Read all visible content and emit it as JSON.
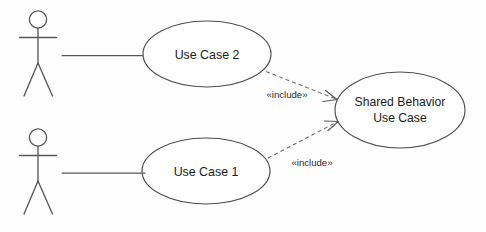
{
  "diagram": {
    "type": "uml-use-case-diagram",
    "background_color": "#fefefe",
    "line_color": "#58585a",
    "text_color": "#1b1b1b",
    "actors": [
      {
        "id": "actor-top",
        "label": ""
      },
      {
        "id": "actor-bottom",
        "label": ""
      }
    ],
    "use_cases": [
      {
        "id": "use-case-2",
        "label": "Use Case 2"
      },
      {
        "id": "use-case-1",
        "label": "Use Case 1"
      },
      {
        "id": "shared-behavior",
        "label_line1": "Shared Behavior",
        "label_line2": "Use Case"
      }
    ],
    "relationships": [
      {
        "id": "include-top",
        "stereotype": "«include»",
        "from": "use-case-2",
        "to": "shared-behavior",
        "style": "dashed-arrow"
      },
      {
        "id": "include-bottom",
        "stereotype": "«include»",
        "from": "use-case-1",
        "to": "shared-behavior",
        "style": "dashed-arrow"
      }
    ],
    "associations": [
      {
        "id": "assoc-top",
        "from": "actor-top",
        "to": "use-case-2",
        "style": "solid-line"
      },
      {
        "id": "assoc-bottom",
        "from": "actor-bottom",
        "to": "use-case-1",
        "style": "solid-line"
      }
    ]
  }
}
